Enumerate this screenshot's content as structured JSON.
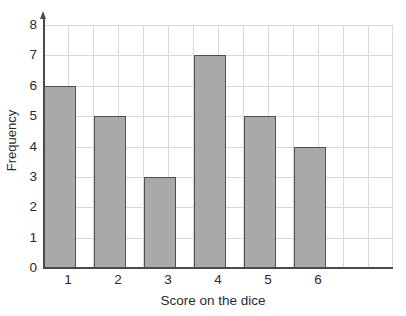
{
  "chart_data": {
    "type": "bar",
    "title": "",
    "subtitle": "",
    "xlabel": "Score on the dice",
    "ylabel": "Frequency",
    "categories": [
      "1",
      "2",
      "3",
      "4",
      "5",
      "6"
    ],
    "values": [
      6,
      5,
      3,
      7,
      5,
      4
    ],
    "series": [
      {
        "name": "Frequency",
        "values": [
          6,
          5,
          3,
          7,
          5,
          4
        ]
      }
    ],
    "ylim": [
      0,
      8
    ],
    "ytick_labels": [
      "0",
      "1",
      "2",
      "3",
      "4",
      "5",
      "6",
      "7",
      "8"
    ],
    "ytick_values": [
      0,
      1,
      2,
      3,
      4,
      5,
      6,
      7,
      8
    ],
    "xtick_labels": [
      "1",
      "2",
      "3",
      "4",
      "5",
      "6"
    ],
    "grid": "both",
    "legend": "none",
    "annotations": [],
    "colors": {
      "bar_fill": "#a9a9a9",
      "bar_edge": "#4f4f4f",
      "gridline": "#d9d9d9",
      "axis": "#4a4a4a",
      "text": "#2b2b2b",
      "background": "#ffffff"
    }
  }
}
